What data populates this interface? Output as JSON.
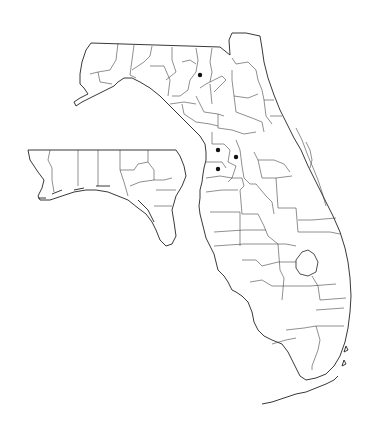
{
  "map": {
    "title": "Florida county distribution map",
    "region": "Florida",
    "inset": "Florida Panhandle (western counties)",
    "colors": {
      "background": "#ffffff",
      "outline": "#222222",
      "marker": "#111111"
    },
    "markers": [
      {
        "id": "m1",
        "x": 200,
        "y": 75,
        "label": "record-north"
      },
      {
        "id": "m2",
        "x": 218,
        "y": 150,
        "label": "record-central-1"
      },
      {
        "id": "m3",
        "x": 236,
        "y": 157,
        "label": "record-central-2"
      },
      {
        "id": "m4",
        "x": 218,
        "y": 169,
        "label": "record-central-3"
      }
    ],
    "marker_count": 4
  }
}
